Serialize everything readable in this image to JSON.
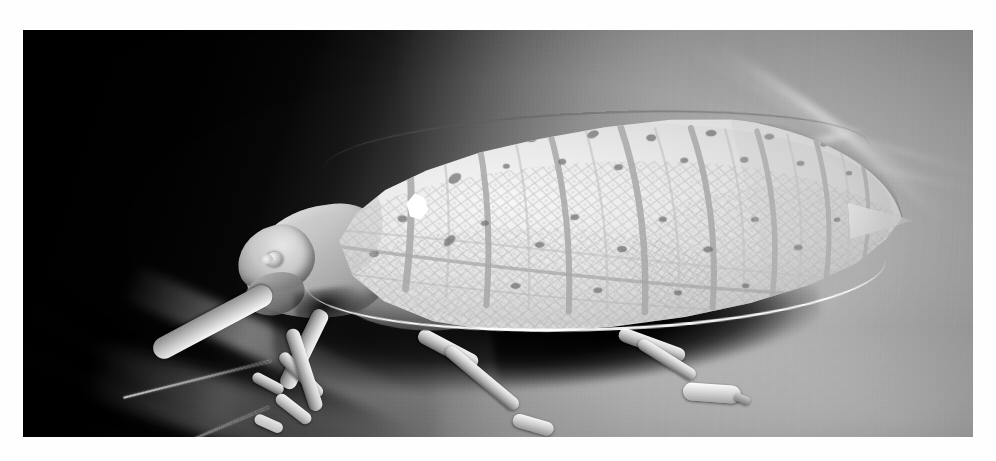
{
  "image": {
    "title": "Leaf-mimicking katydid on a leaf",
    "type": "black-and-white photograph",
    "orientation": "landscape",
    "caption": "",
    "plate": {
      "left": 23,
      "top": 30,
      "width": 950,
      "height": 407,
      "border_color": "#ffffff",
      "background_color": "#6e6e6e"
    }
  },
  "palette": {
    "paper_white": "#ffffff",
    "background_dark": "#070707",
    "background_mid_gray": "#9d9d9d",
    "wing_light": "#f2f2f2",
    "wing_mid": "#d9d9d9",
    "wing_shadow": "#bdbdbd",
    "vein_gray": "#b3b3b3",
    "speckle_dark": "#6f6f6f",
    "shadow_black": "#000000",
    "eyespot_white": "#ffffff",
    "leg_highlight": "#f4f4f4"
  },
  "subject": {
    "name": "katydid",
    "common_description": "leaf-mimicking katydid in left profile",
    "parts": [
      {
        "name": "head",
        "label": "head"
      },
      {
        "name": "compound-eye",
        "label": "compound eye"
      },
      {
        "name": "antenna-upper",
        "label": "upper antenna"
      },
      {
        "name": "antenna-lower",
        "label": "lower antenna"
      },
      {
        "name": "pronotum",
        "label": "pronotum"
      },
      {
        "name": "tegmen",
        "label": "leaf-like forewing (tegmen)"
      },
      {
        "name": "wing-eyespot",
        "label": "white eyespot on forewing"
      },
      {
        "name": "wing-tip",
        "label": "pointed wing apex"
      },
      {
        "name": "abdomen",
        "label": "abdomen"
      },
      {
        "name": "foreleg",
        "label": "foreleg"
      },
      {
        "name": "midleg",
        "label": "middle leg"
      },
      {
        "name": "hindleg",
        "label": "hind leg"
      },
      {
        "name": "tarsus",
        "label": "tarsus"
      }
    ]
  },
  "scene": {
    "background_description": "dark shaded leaf surface at upper left grading to a lit mid-gray leaf blade at lower right",
    "light_streaks": 6,
    "dark_veins": 3,
    "shadow_under_body": true
  },
  "wing_pattern": {
    "cross_vein_count": 8,
    "longitudinal_vein_count": 3,
    "reticulate_cells": true,
    "dark_speckle_count": 34,
    "eyespot_count": 1,
    "bright_lower_rim": true
  }
}
